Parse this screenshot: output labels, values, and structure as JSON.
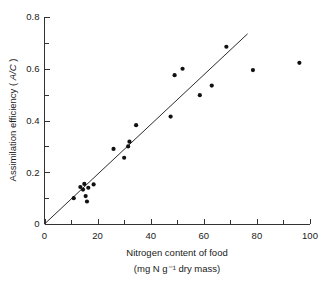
{
  "chart_data": {
    "type": "scatter",
    "title": "",
    "xlabel": "Nitrogen content of food",
    "xlabel_line2": "(mg N g⁻¹ dry mass)",
    "ylabel": "Assimilation efficiency ( A/C )",
    "ylabel_prefix": "Assimilation efficiency ( ",
    "ylabel_italic": "A/C",
    "ylabel_suffix": " )",
    "xlim": [
      0,
      100
    ],
    "ylim": [
      0,
      0.8
    ],
    "x_major_ticks": [
      0,
      20,
      40,
      60,
      80,
      100
    ],
    "x_minor_ticks": [
      10,
      30,
      50,
      70,
      90
    ],
    "x_tick_labels": [
      "0",
      "20",
      "40",
      "60",
      "80",
      "100"
    ],
    "y_major_ticks": [
      0,
      0.2,
      0.4,
      0.6,
      0.8
    ],
    "y_minor_ticks": [
      0.1,
      0.3,
      0.5,
      0.7
    ],
    "y_tick_labels": [
      "0",
      "0.2",
      "0.4",
      "0.6",
      "0.8"
    ],
    "grid": false,
    "legend": null,
    "marker": "filled-circle",
    "marker_color": "#111111",
    "line_color": "#2b2b2b",
    "points": [
      {
        "x": 11.0,
        "y": 0.1
      },
      {
        "x": 13.5,
        "y": 0.143
      },
      {
        "x": 14.5,
        "y": 0.133
      },
      {
        "x": 15.0,
        "y": 0.155
      },
      {
        "x": 15.5,
        "y": 0.108
      },
      {
        "x": 16.0,
        "y": 0.087
      },
      {
        "x": 16.5,
        "y": 0.14
      },
      {
        "x": 18.5,
        "y": 0.153
      },
      {
        "x": 26.0,
        "y": 0.29
      },
      {
        "x": 30.0,
        "y": 0.256
      },
      {
        "x": 31.5,
        "y": 0.3
      },
      {
        "x": 32.0,
        "y": 0.318
      },
      {
        "x": 34.5,
        "y": 0.382
      },
      {
        "x": 47.5,
        "y": 0.415
      },
      {
        "x": 49.0,
        "y": 0.575
      },
      {
        "x": 52.0,
        "y": 0.6
      },
      {
        "x": 58.5,
        "y": 0.498
      },
      {
        "x": 63.0,
        "y": 0.535
      },
      {
        "x": 68.5,
        "y": 0.685
      },
      {
        "x": 78.5,
        "y": 0.595
      },
      {
        "x": 96.0,
        "y": 0.623
      }
    ],
    "fit_line": {
      "type": "linear-regression",
      "x_start": 0.0,
      "y_start": 0.0,
      "x_end": 76.5,
      "y_end": 0.735
    }
  }
}
